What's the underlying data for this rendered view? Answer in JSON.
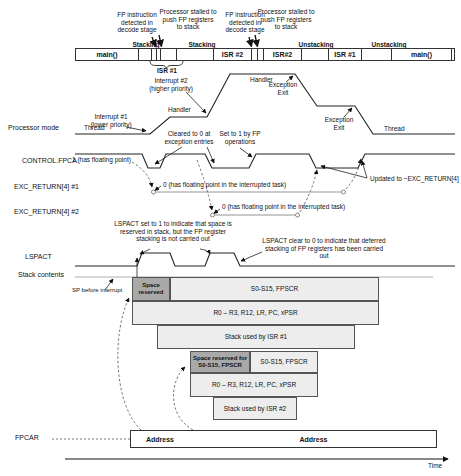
{
  "colors": {
    "box_fill": "#ededed",
    "box_fill_dark": "#a9a9a9",
    "line": "#1a1a1a"
  },
  "top_annotations": {
    "fp_detect_1": "FP instruction detected in decode stage",
    "stall_1": "Processor stalled to push FP registers to stack",
    "stacking_1": "Stacking",
    "fp_detect_2": "FP instruction detected in decode stage",
    "stall_2": "Processor stalled to push FP registers to stack",
    "stacking_2": "Stacking",
    "unstacking_1": "Unstacking",
    "unstacking_2": "Unstacking",
    "isr1_brace_label": "ISR #1"
  },
  "timeline_bar": {
    "cells": [
      "main()",
      "",
      "",
      "",
      "",
      "",
      "ISR #2",
      "",
      "",
      "ISR#2",
      "",
      "ISR #1",
      "",
      "main()",
      ""
    ]
  },
  "processor_mode": {
    "row_label": "Processor mode",
    "thread_left": "Thread",
    "thread_right": "Thread",
    "handler_mid": "Handler",
    "handler_top": "Handler",
    "interrupt1_note": "Interrupt #1 (lower priority)",
    "interrupt2_note": "Interrupt #2 (higher priority)",
    "exception_exit_1": "Exception Exit",
    "exception_exit_2": "Exception Exit"
  },
  "control_fpca": {
    "row_label": "CONTROL.FPCA",
    "value_label": "1 (has floating point)",
    "cleared_note": "Cleared to 0 at exception entries",
    "set_note": "Set to 1 by FP operations",
    "updated_note": "Updated to ~EXC_RETURN[4]"
  },
  "exc_return_1": {
    "row_label": "EXC_RETURN[4] #1",
    "value_label": "0 (has floating point in the interrupted task)"
  },
  "exc_return_2": {
    "row_label": "EXC_RETURN[4] #2",
    "value_label": "0 (has floating point in the interrupted task)"
  },
  "lspact": {
    "row_label": "LSPACT",
    "set_note": "LSPACT set to 1 to indicate that space is reserved in stack, but the FP register stacking is not carried out",
    "clear_note": "LSPACT clear to 0 to indicate that deferred stacking of FP registers has been carried out"
  },
  "stack": {
    "row_label": "Stack contents",
    "sp_label": "SP before interrupt",
    "frame1": {
      "space_reserved": "Space reserved",
      "fp_regs": "S0-S15, FPSCR",
      "core_regs": "R0 – R3, R12, LR, PC, xPSR",
      "isr_stack": "Stack used by ISR #1"
    },
    "frame2": {
      "space_reserved": "Space reserved for S0-S15, FPSCR",
      "fp_regs": "S0-S15, FPSCR",
      "core_regs": "R0 – R3, R12, LR, PC, xPSR",
      "isr_stack": "Stack used by ISR #2"
    }
  },
  "fpcar": {
    "row_label": "FPCAR",
    "address1": "Address",
    "address2": "Address"
  },
  "time_axis": {
    "label": "Time"
  }
}
